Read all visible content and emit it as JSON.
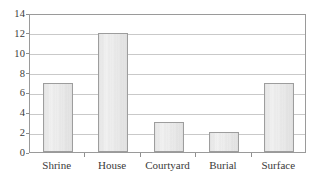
{
  "chart_data": {
    "type": "bar",
    "title": "",
    "subtitle": "",
    "xlabel": "",
    "ylabel": "",
    "categories": [
      "Shrine",
      "House",
      "Courtyard",
      "Burial",
      "Surface"
    ],
    "values": [
      7,
      12,
      3,
      2,
      7
    ],
    "ylim": [
      0,
      14
    ],
    "ytick_labels": [
      "0",
      "2",
      "4",
      "6",
      "8",
      "10",
      "12",
      "14"
    ],
    "ytick_values": [
      0,
      2,
      4,
      6,
      8,
      10,
      12,
      14
    ],
    "grid": "horizontal",
    "legend": "none",
    "annotations": [],
    "colors": {
      "bar_fill": "#ededed",
      "bar_border": "#9d9d9d",
      "gridline": "#c9c9c9",
      "axis": "#9a9a9a",
      "text": "#3a3a3a",
      "background": "#ffffff"
    }
  }
}
